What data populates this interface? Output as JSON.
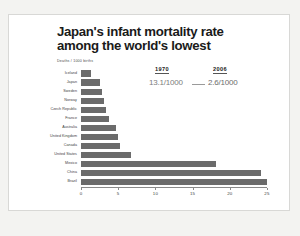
{
  "slide": {
    "title_lines": [
      "Japan's infant mortality rate",
      "among the world's lowest"
    ],
    "axis_note": "Deaths / 1000 births",
    "footer": ""
  },
  "callout": {
    "year_old_label": "1970",
    "year_new_label": "2006",
    "value_old": "13.1/1000",
    "value_new": "2.6/1000",
    "arrow": "arrow-right"
  },
  "colors": {
    "bar": "#6b6b6b",
    "slide_background": "#ffffff",
    "page_background": "#f3f3f1",
    "title": "#1a1a1a",
    "axis": "#8a8a8a"
  },
  "chart_data": {
    "type": "bar",
    "orientation": "horizontal",
    "title": "Japan's infant mortality rate among the world's lowest",
    "xlabel": "Deaths / 1000 births",
    "ylabel": "",
    "xlim": [
      0,
      25
    ],
    "grid": false,
    "legend": "none",
    "categories": [
      "Iceland",
      "Japan",
      "Sweden",
      "Norway",
      "Czech Republic",
      "France",
      "Australia",
      "United Kingdom",
      "Canada",
      "United States",
      "Mexico",
      "China",
      "Brazil"
    ],
    "values": [
      1.4,
      2.6,
      2.8,
      3.1,
      3.3,
      3.8,
      4.7,
      5.0,
      5.3,
      6.7,
      18.2,
      24.2,
      25.0
    ],
    "ticks": [
      0,
      5,
      10,
      15,
      20,
      25
    ],
    "tick_labels": [
      "0",
      "5",
      "10",
      "15",
      "20",
      "25"
    ]
  }
}
